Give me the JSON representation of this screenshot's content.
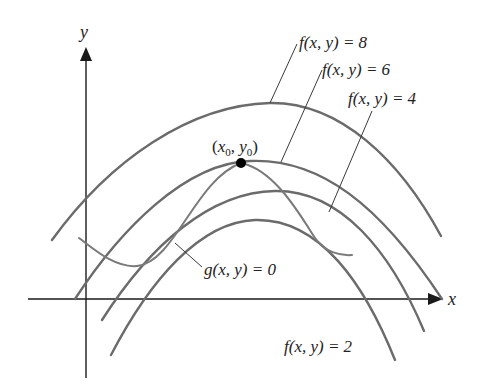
{
  "diagram": {
    "axes": {
      "x_label": "x",
      "y_label": "y"
    },
    "level_curves": [
      {
        "name": "f8",
        "label": "f(x, y) = 8",
        "value": 8
      },
      {
        "name": "f6",
        "label": "f(x, y) = 6",
        "value": 6
      },
      {
        "name": "f4",
        "label": "f(x, y) = 4",
        "value": 4
      },
      {
        "name": "f2",
        "label": "f(x, y) = 2",
        "value": 2
      }
    ],
    "constraint": {
      "label": "g(x, y) = 0"
    },
    "tangent_point": {
      "label": "(x0, y0)",
      "x_sym": "x",
      "x_sub": "0",
      "y_sym": "y",
      "y_sub": "0"
    },
    "colors": {
      "curve": "#6b6b6b",
      "constraint": "#7a7a7a",
      "axis": "#1a1a1a",
      "point": "#000000"
    }
  }
}
